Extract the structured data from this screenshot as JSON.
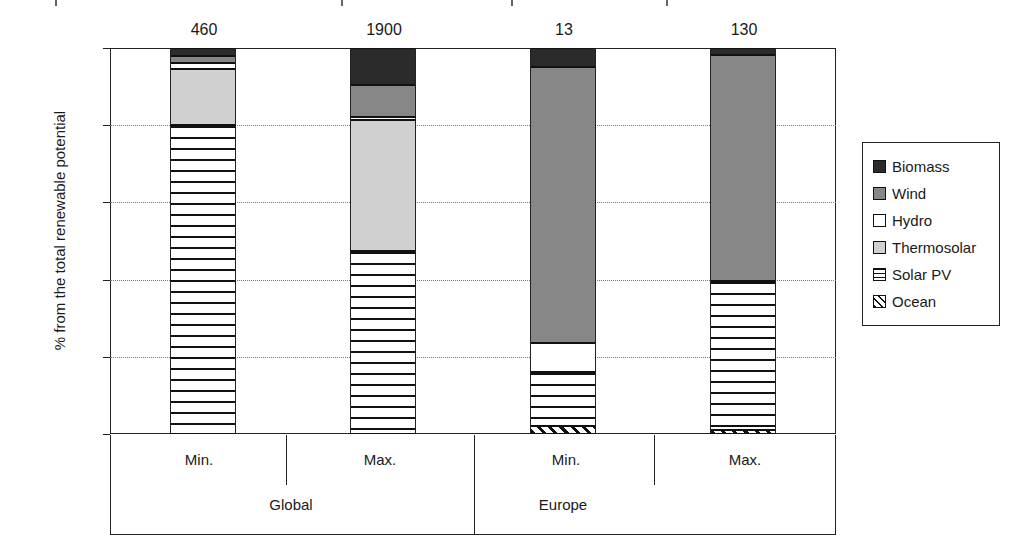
{
  "chart_data": {
    "type": "bar",
    "subtype": "stacked-percentage",
    "title": "",
    "xlabel": "",
    "ylabel": "% from the total renewable potential",
    "ylim": [
      0,
      100
    ],
    "yticks": [
      0,
      20,
      40,
      60,
      80,
      100
    ],
    "ytick_labels": [
      "0",
      "20",
      "40",
      "60",
      "80",
      "100"
    ],
    "grid": "horizontal-dotted",
    "legend_position": "right",
    "categories": [
      "Min.",
      "Max.",
      "Min.",
      "Max."
    ],
    "groups": [
      {
        "label": "Global",
        "categories": [
          "Min.",
          "Max."
        ]
      },
      {
        "label": "Europe",
        "categories": [
          "Min.",
          "Max."
        ]
      }
    ],
    "bar_value_labels": [
      "460",
      "1900",
      "13",
      "130"
    ],
    "series": [
      {
        "name": "Biomass",
        "color": "#2b2b2b",
        "pattern": "solid",
        "values": [
          2.0,
          9.6,
          5.0,
          1.8
        ]
      },
      {
        "name": "Wind",
        "color": "#878787",
        "pattern": "solid",
        "values": [
          1.8,
          8.3,
          71.5,
          58.5
        ]
      },
      {
        "name": "Hydro",
        "color": "#ffffff",
        "pattern": "solid",
        "values": [
          1.7,
          0.8,
          7.5,
          0.0
        ]
      },
      {
        "name": "Thermosolar",
        "color": "#d0d0d0",
        "pattern": "solid",
        "values": [
          14.5,
          34.0,
          0.0,
          0.0
        ]
      },
      {
        "name": "Solar PV",
        "color": "#ffffff",
        "pattern": "horizontal",
        "values": [
          80.0,
          47.3,
          14.0,
          38.7
        ]
      },
      {
        "name": "Ocean",
        "color": "#ffffff",
        "pattern": "diagonal",
        "values": [
          0.0,
          0.0,
          2.0,
          1.0
        ]
      }
    ],
    "bars": [
      {
        "group": "Global",
        "category": "Min.",
        "value_label": "460",
        "stack": [
          {
            "name": "Solar PV",
            "value": 80.0,
            "from": 0.0,
            "to": 80.0
          },
          {
            "name": "Thermosolar",
            "value": 14.5,
            "from": 80.0,
            "to": 94.5
          },
          {
            "name": "Hydro",
            "value": 1.7,
            "from": 94.5,
            "to": 96.2
          },
          {
            "name": "Wind",
            "value": 1.8,
            "from": 96.2,
            "to": 98.0
          },
          {
            "name": "Biomass",
            "value": 2.0,
            "from": 98.0,
            "to": 100.0
          }
        ]
      },
      {
        "group": "Global",
        "category": "Max.",
        "value_label": "1900",
        "stack": [
          {
            "name": "Solar PV",
            "value": 47.3,
            "from": 0.0,
            "to": 47.3
          },
          {
            "name": "Thermosolar",
            "value": 34.0,
            "from": 47.3,
            "to": 81.3
          },
          {
            "name": "Hydro",
            "value": 0.8,
            "from": 81.3,
            "to": 82.1
          },
          {
            "name": "Wind",
            "value": 8.3,
            "from": 82.1,
            "to": 90.4
          },
          {
            "name": "Biomass",
            "value": 9.6,
            "from": 90.4,
            "to": 100.0
          }
        ]
      },
      {
        "group": "Europe",
        "category": "Min.",
        "value_label": "13",
        "stack": [
          {
            "name": "Ocean",
            "value": 2.0,
            "from": 0.0,
            "to": 2.0
          },
          {
            "name": "Solar PV",
            "value": 14.0,
            "from": 2.0,
            "to": 16.0
          },
          {
            "name": "Hydro",
            "value": 7.5,
            "from": 16.0,
            "to": 23.5
          },
          {
            "name": "Wind",
            "value": 71.5,
            "from": 23.5,
            "to": 95.0
          },
          {
            "name": "Biomass",
            "value": 5.0,
            "from": 95.0,
            "to": 100.0
          }
        ]
      },
      {
        "group": "Europe",
        "category": "Max.",
        "value_label": "130",
        "stack": [
          {
            "name": "Ocean",
            "value": 1.0,
            "from": 0.0,
            "to": 1.0
          },
          {
            "name": "Solar PV",
            "value": 38.7,
            "from": 1.0,
            "to": 39.7
          },
          {
            "name": "Wind",
            "value": 58.5,
            "from": 39.7,
            "to": 98.2
          },
          {
            "name": "Biomass",
            "value": 1.8,
            "from": 98.2,
            "to": 100.0
          }
        ]
      }
    ]
  },
  "legend": {
    "items": [
      {
        "label": "Biomass",
        "swatch": "biomass"
      },
      {
        "label": "Wind",
        "swatch": "wind"
      },
      {
        "label": "Hydro",
        "swatch": "hydro"
      },
      {
        "label": "Thermosolar",
        "swatch": "thermo"
      },
      {
        "label": "Solar PV",
        "swatch": "solarpv"
      },
      {
        "label": "Ocean",
        "swatch": "ocean"
      }
    ]
  }
}
